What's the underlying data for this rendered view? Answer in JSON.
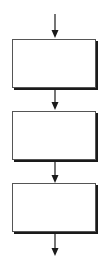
{
  "diagram": {
    "type": "flowchart",
    "direction": "top-to-bottom",
    "colors": {
      "stroke": "#1a1a1a",
      "border": "#555555",
      "fill": "#ffffff"
    },
    "boxes": [
      {
        "label": ""
      },
      {
        "label": ""
      },
      {
        "label": ""
      }
    ],
    "arrows": [
      {
        "from": "entry",
        "to": "box-1"
      },
      {
        "from": "box-1",
        "to": "box-2"
      },
      {
        "from": "box-2",
        "to": "box-3"
      },
      {
        "from": "box-3",
        "to": "exit"
      }
    ]
  }
}
